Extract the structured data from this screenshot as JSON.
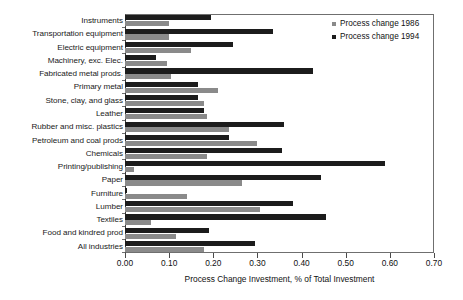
{
  "chart_data": {
    "type": "bar",
    "orientation": "horizontal",
    "title": "",
    "xlabel": "Process Change Investment, % of Total Investment",
    "ylabel": "",
    "xlim": [
      0.0,
      0.7
    ],
    "xticks": [
      "0.00",
      "0.10",
      "0.20",
      "0.30",
      "0.40",
      "0.50",
      "0.60",
      "0.70"
    ],
    "xtick_values": [
      0.0,
      0.1,
      0.2,
      0.3,
      0.4,
      0.5,
      0.6,
      0.7
    ],
    "grid": false,
    "legend_position": "top-right",
    "categories": [
      "Instruments",
      "Transportation equipment",
      "Electric equipment",
      "Machinery, exc. Elec.",
      "Fabricated metal prods.",
      "Primary metal",
      "Stone, clay, and glass",
      "Leather",
      "Rubber and misc. plastics",
      "Petroleum and coal prods",
      "Chemicals",
      "Printing/publishing",
      "Paper",
      "Furniture",
      "Lumber",
      "Textiles",
      "Food and kindred prod",
      "All industries"
    ],
    "series": [
      {
        "name": "Process change 1986",
        "color": "#8a8a8a",
        "values": [
          0.1,
          0.1,
          0.15,
          0.095,
          0.105,
          0.21,
          0.18,
          0.185,
          0.235,
          0.3,
          0.185,
          0.02,
          0.265,
          0.14,
          0.305,
          0.06,
          0.115,
          0.18
        ]
      },
      {
        "name": "Process change 1994",
        "color": "#1c1c1c",
        "values": [
          0.195,
          0.335,
          0.245,
          0.07,
          0.425,
          0.165,
          0.165,
          0.18,
          0.36,
          0.235,
          0.355,
          0.59,
          0.445,
          0.005,
          0.38,
          0.455,
          0.19,
          0.295
        ]
      }
    ]
  },
  "legend": {
    "items": [
      {
        "label": "Process change 1986",
        "color": "#8a8a8a"
      },
      {
        "label": "Process change 1994",
        "color": "#1c1c1c"
      }
    ]
  }
}
